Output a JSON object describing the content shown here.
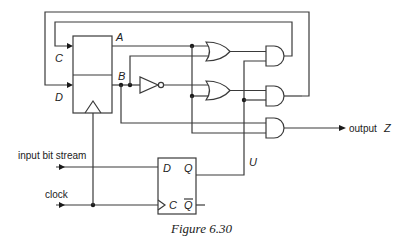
{
  "figure": {
    "caption": "Figure 6.30",
    "register": {
      "outputs": [
        "A",
        "B"
      ],
      "inputs": [
        "C",
        "D"
      ]
    },
    "flip_flop": {
      "input_label": "D",
      "clock_label": "C",
      "output_label": "Q",
      "output_bar_label": "Q"
    },
    "signals": {
      "input": "input bit stream",
      "clock": "clock",
      "output": "output",
      "output_var": "Z",
      "u": "U"
    },
    "gates": [
      "OR",
      "AND",
      "NOT",
      "OR",
      "AND",
      "AND"
    ]
  }
}
